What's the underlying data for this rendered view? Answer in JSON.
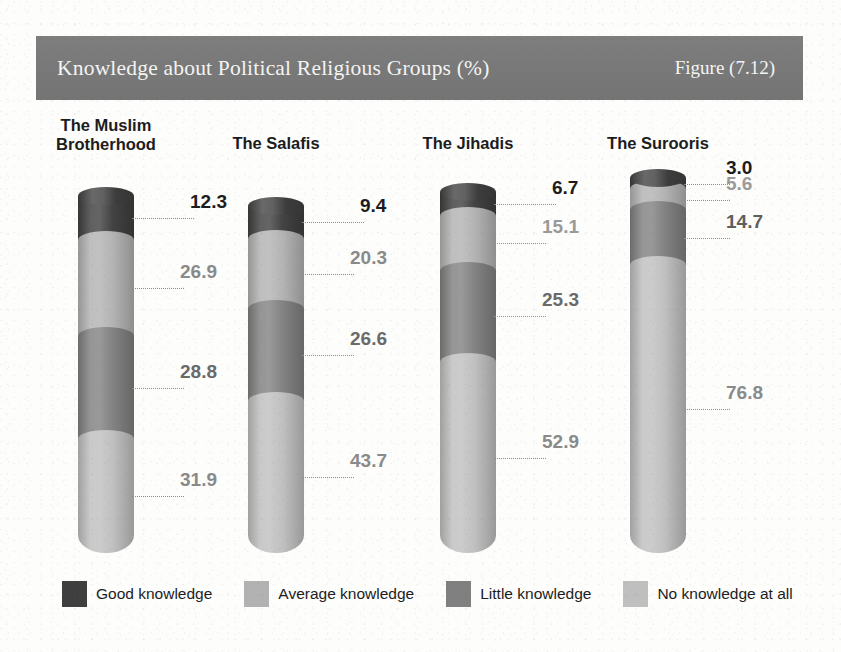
{
  "header": {
    "title": "Knowledge about Political Religious Groups (%)",
    "figure_number": "Figure (7.12)",
    "band_color": "#7b7b7b",
    "text_color": "#f4f4f2"
  },
  "legend": {
    "items": [
      {
        "label": "Good knowledge",
        "color": "#3f3f3f"
      },
      {
        "label": "Average knowledge",
        "color": "#b2b2b2"
      },
      {
        "label": "Little knowledge",
        "color": "#808080"
      },
      {
        "label": "No knowledge at all",
        "color": "#bfbfbf"
      }
    ]
  },
  "chart_data": {
    "type": "bar",
    "subtype": "stacked-cylinder",
    "title": "Knowledge about Political Religious Groups (%)",
    "xlabel": "",
    "ylabel": "",
    "ylim": [
      0,
      100
    ],
    "grid": false,
    "legend_position": "bottom",
    "categories": [
      "The Muslim Brotherhood",
      "The Salafis",
      "The Jihadis",
      "The Surooris"
    ],
    "series": [
      {
        "name": "Good knowledge",
        "color": "#3f3f3f",
        "values": [
          12.3,
          9.4,
          6.7,
          3.0
        ]
      },
      {
        "name": "Average knowledge",
        "color": "#b2b2b2",
        "values": [
          26.9,
          20.3,
          15.1,
          5.6
        ]
      },
      {
        "name": "Little knowledge",
        "color": "#808080",
        "values": [
          28.8,
          26.6,
          25.3,
          14.7
        ]
      },
      {
        "name": "No knowledge at all",
        "color": "#bfbfbf",
        "values": [
          31.9,
          43.7,
          52.9,
          76.8
        ]
      }
    ],
    "value_labels": {
      "The Muslim Brotherhood": [
        "12.3",
        "26.9",
        "28.8",
        "31.9"
      ],
      "The Salafis": [
        "9.4",
        "20.3",
        "26.6",
        "43.7"
      ],
      "The Jihadis": [
        "6.7",
        "15.1",
        "25.3",
        "52.9"
      ],
      "The Surooris": [
        "3.0",
        "5.6",
        "14.7",
        "76.8"
      ]
    }
  },
  "groups": [
    {
      "label_line1": "The Muslim",
      "label_line2": "Brotherhood",
      "segments": [
        {
          "label": "12.3",
          "value": 12.3,
          "series": "Good knowledge",
          "color": "#3f3f3f",
          "label_color": "#1c1c1c"
        },
        {
          "label": "26.9",
          "value": 26.9,
          "series": "Average knowledge",
          "color": "#b2b2b2",
          "label_color": "#8a8a8a"
        },
        {
          "label": "28.8",
          "value": 28.8,
          "series": "Little knowledge",
          "color": "#808080",
          "label_color": "#6a6a6a"
        },
        {
          "label": "31.9",
          "value": 31.9,
          "series": "No knowledge at all",
          "color": "#bfbfbf",
          "label_color": "#8a8a8a"
        }
      ]
    },
    {
      "label_line1": "The Salafis",
      "label_line2": "",
      "segments": [
        {
          "label": "9.4",
          "value": 9.4,
          "series": "Good knowledge",
          "color": "#3f3f3f",
          "label_color": "#1c1c1c"
        },
        {
          "label": "20.3",
          "value": 20.3,
          "series": "Average knowledge",
          "color": "#b2b2b2",
          "label_color": "#8a8a8a"
        },
        {
          "label": "26.6",
          "value": 26.6,
          "series": "Little knowledge",
          "color": "#808080",
          "label_color": "#6a6a6a"
        },
        {
          "label": "43.7",
          "value": 43.7,
          "series": "No knowledge at all",
          "color": "#bfbfbf",
          "label_color": "#8a8a8a"
        }
      ]
    },
    {
      "label_line1": "The Jihadis",
      "label_line2": "",
      "segments": [
        {
          "label": "6.7",
          "value": 6.7,
          "series": "Good knowledge",
          "color": "#3f3f3f",
          "label_color": "#1c1c1c"
        },
        {
          "label": "15.1",
          "value": 15.1,
          "series": "Average knowledge",
          "color": "#b2b2b2",
          "label_color": "#9a9a9a"
        },
        {
          "label": "25.3",
          "value": 25.3,
          "series": "Little knowledge",
          "color": "#808080",
          "label_color": "#6a6a6a"
        },
        {
          "label": "52.9",
          "value": 52.9,
          "series": "No knowledge at all",
          "color": "#bfbfbf",
          "label_color": "#8a8a8a"
        }
      ]
    },
    {
      "label_line1": "The Surooris",
      "label_line2": "",
      "segments": [
        {
          "label": "3.0",
          "value": 3.0,
          "series": "Good knowledge",
          "color": "#3f3f3f",
          "label_color": "#1c1c1c"
        },
        {
          "label": "5.6",
          "value": 5.6,
          "series": "Average knowledge",
          "color": "#b2b2b2",
          "label_color": "#9a9a9a"
        },
        {
          "label": "14.7",
          "value": 14.7,
          "series": "Little knowledge",
          "color": "#808080",
          "label_color": "#5f5f5f"
        },
        {
          "label": "76.8",
          "value": 76.8,
          "series": "No knowledge at all",
          "color": "#bfbfbf",
          "label_color": "#8a8a8a"
        }
      ]
    }
  ]
}
